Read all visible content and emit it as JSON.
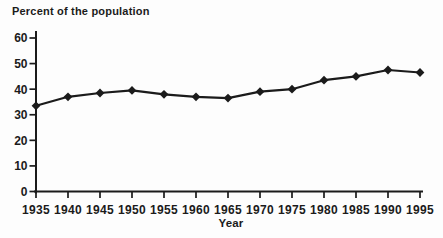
{
  "colors": {
    "background": "#fdfdfd",
    "ink": "#1b1b1b"
  },
  "chart_data": {
    "type": "line",
    "title": "Percent of the population",
    "xlabel": "Year",
    "ylabel": "Percent of the population",
    "x": [
      1935,
      1940,
      1945,
      1950,
      1955,
      1960,
      1965,
      1970,
      1975,
      1980,
      1985,
      1990,
      1995
    ],
    "xtick_labels": [
      "1935",
      "1940",
      "1945",
      "1950",
      "1955",
      "1960",
      "1965",
      "1970",
      "1975",
      "1980",
      "1985",
      "1990",
      "1995"
    ],
    "values": [
      33.5,
      37,
      38.5,
      39.5,
      38,
      37,
      36.5,
      39,
      40,
      43.5,
      45,
      47.5,
      46.5
    ],
    "ylim": [
      0,
      60
    ],
    "yticks": [
      0,
      10,
      20,
      30,
      40,
      50,
      60
    ],
    "grid": false,
    "legend": "none",
    "marker": "diamond",
    "line_color": "#1b1b1b",
    "marker_color": "#1b1b1b"
  }
}
